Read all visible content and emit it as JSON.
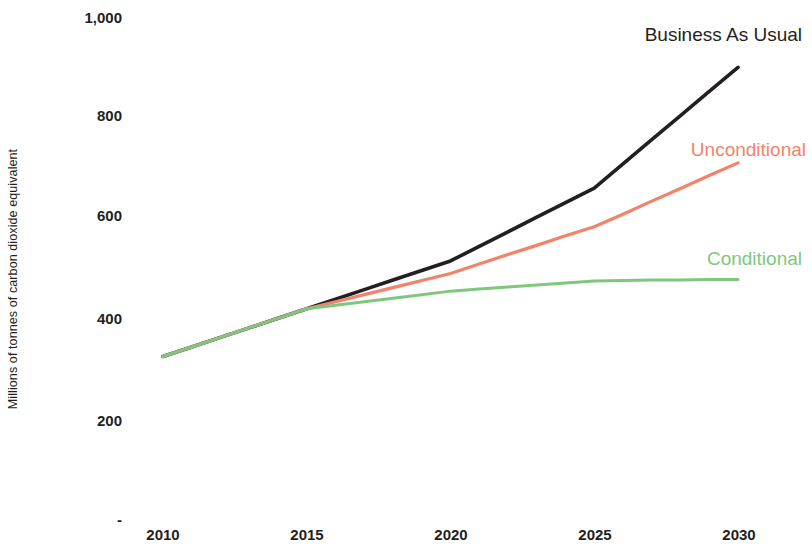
{
  "chart_data": {
    "type": "line",
    "title": "",
    "xlabel": "",
    "ylabel": "Millions of tonnes of carbon dioxide equivalent",
    "x": [
      2010,
      2011,
      2012,
      2013,
      2014,
      2015,
      2016,
      2017,
      2018,
      2019,
      2020,
      2021,
      2022,
      2023,
      2024,
      2025,
      2026,
      2027,
      2028,
      2029,
      2030
    ],
    "xlim": [
      2010,
      2030
    ],
    "ylim": [
      0,
      1000
    ],
    "x_tick_labels": [
      "2010",
      "2015",
      "2020",
      "2025",
      "2030"
    ],
    "x_tick_values": [
      2010,
      2015,
      2020,
      2025,
      2030
    ],
    "y_tick_labels": [
      "1,000",
      "800",
      "600",
      "400",
      "200",
      "-"
    ],
    "y_tick_values": [
      1000,
      800,
      600,
      400,
      200,
      0
    ],
    "grid": false,
    "legend_position": "inline-right-of-series",
    "series": [
      {
        "name": "Business As Usual",
        "color": "#231f20",
        "values": [
          325,
          344,
          363,
          382,
          401,
          420,
          439,
          458,
          477,
          496,
          515,
          544,
          573,
          602,
          631,
          660,
          708,
          756,
          804,
          852,
          900
        ]
      },
      {
        "name": "Unconditional",
        "color": "#f2836a",
        "values": [
          325,
          344,
          363,
          382,
          401,
          420,
          434,
          448,
          462,
          476,
          490,
          509,
          528,
          546,
          565,
          583,
          608,
          634,
          659,
          685,
          710
        ]
      },
      {
        "name": "Conditional",
        "color": "#7dc87d",
        "values": [
          325,
          344,
          363,
          382,
          401,
          420,
          427,
          434,
          441,
          448,
          455,
          459,
          463,
          467,
          471,
          475,
          476,
          477,
          477,
          478,
          478
        ]
      }
    ]
  },
  "axes": {
    "y_title": "Millions of tonnes of carbon dioxide equivalent",
    "y_ticks": [
      {
        "label": "1,000",
        "value": 1000
      },
      {
        "label": "800",
        "value": 800
      },
      {
        "label": "600",
        "value": 600
      },
      {
        "label": "400",
        "value": 400
      },
      {
        "label": "200",
        "value": 200
      },
      {
        "label": "-",
        "value": 0
      }
    ],
    "x_ticks": [
      {
        "label": "2010",
        "value": 2010
      },
      {
        "label": "2015",
        "value": 2015
      },
      {
        "label": "2020",
        "value": 2020
      },
      {
        "label": "2025",
        "value": 2025
      },
      {
        "label": "2030",
        "value": 2030
      }
    ]
  },
  "labels": {
    "business_as_usual": "Business As Usual",
    "unconditional": "Unconditional",
    "conditional": "Conditional"
  },
  "colors": {
    "business_as_usual": "#231f20",
    "unconditional": "#f2836a",
    "conditional": "#7dc87d",
    "text": "#231f20",
    "background": "#ffffff"
  }
}
